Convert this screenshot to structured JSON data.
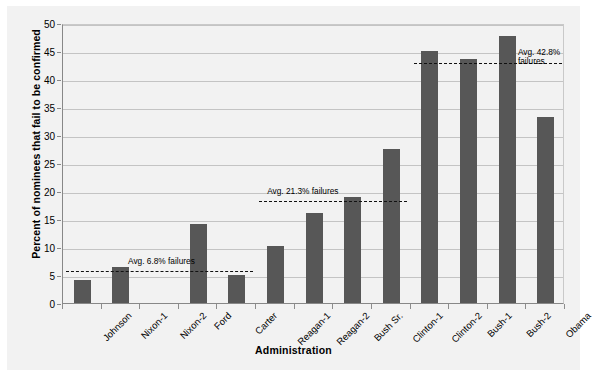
{
  "chart_data": {
    "type": "bar",
    "title": "",
    "xlabel": "Administration",
    "ylabel": "Percent of nominees that fail to be confirmed",
    "categories": [
      "Johnson",
      "Nixon-1",
      "Nixon-2",
      "Ford",
      "Carter",
      "Reagan-1",
      "Reagan-2",
      "Bush Sr.",
      "Clinton-1",
      "Clinton-2",
      "Bush-1",
      "Bush-2",
      "Obama"
    ],
    "values": [
      4.1,
      6.5,
      0,
      14.1,
      5.0,
      10.1,
      16.1,
      19.0,
      27.5,
      45.0,
      43.5,
      47.7,
      33.3
    ],
    "ylim": [
      0,
      50
    ],
    "yticks": [
      0,
      5,
      10,
      15,
      20,
      25,
      30,
      35,
      40,
      45,
      50
    ],
    "ytick_labels": [
      "0",
      "5",
      "10",
      "15",
      "20",
      "25",
      "30",
      "35",
      "40",
      "45",
      "50"
    ],
    "grid": true,
    "legend": "none",
    "bar_color": "#575757",
    "background_color": "#f2f2f2",
    "gridline_color": "#c4c4c4",
    "annotations": [
      {
        "name": "avg-johnson-carter",
        "text": "Avg. 6.8% failures",
        "value": 6.0,
        "span_categories": [
          "Johnson",
          "Carter"
        ]
      },
      {
        "name": "avg-reagan-clinton1",
        "text": "Avg. 21.3% failures",
        "value": 18.6,
        "span_categories": [
          "Reagan-1",
          "Clinton-1"
        ]
      },
      {
        "name": "avg-clinton2-obama",
        "text": "Avg. 42.8%\nfailures",
        "value": 43.3,
        "span_categories": [
          "Clinton-2",
          "Obama"
        ]
      }
    ]
  }
}
